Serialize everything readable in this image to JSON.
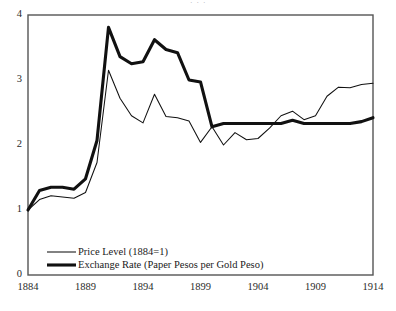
{
  "figure": {
    "top_clipped_text": "·                    ·                    ·",
    "background": "#ffffff",
    "frame_color": "#4d4d4d"
  },
  "chart_data": {
    "type": "line",
    "title": "",
    "subtitle": "",
    "xlabel": "",
    "ylabel": "",
    "xlim": [
      1884,
      1914
    ],
    "ylim": [
      0,
      4
    ],
    "grid": false,
    "legend_position": "bottom-left",
    "xticks": [
      1884,
      1889,
      1894,
      1899,
      1904,
      1909,
      1914
    ],
    "xtick_labels": [
      "1884",
      "1889",
      "1894",
      "1899",
      "1904",
      "1909",
      "1914"
    ],
    "yticks": [
      0,
      1,
      2,
      3,
      4
    ],
    "ytick_labels": [
      "0",
      "1",
      "2",
      "3",
      "4"
    ],
    "x": [
      1884,
      1885,
      1886,
      1887,
      1888,
      1889,
      1890,
      1891,
      1892,
      1893,
      1894,
      1895,
      1896,
      1897,
      1898,
      1899,
      1900,
      1901,
      1902,
      1903,
      1904,
      1905,
      1906,
      1907,
      1908,
      1909,
      1910,
      1911,
      1912,
      1913,
      1914
    ],
    "series": [
      {
        "name": "Price Level (1884=1)",
        "color": "#111111",
        "linewidth": 1.0,
        "style": "thin",
        "values": [
          1.0,
          1.16,
          1.22,
          1.2,
          1.18,
          1.27,
          1.73,
          3.15,
          2.72,
          2.45,
          2.34,
          2.78,
          2.44,
          2.42,
          2.37,
          2.04,
          2.28,
          2.0,
          2.19,
          2.08,
          2.1,
          2.26,
          2.45,
          2.52,
          2.39,
          2.45,
          2.75,
          2.89,
          2.88,
          2.93,
          2.95
        ]
      },
      {
        "name": "Exchange Rate (Paper Pesos per Gold Peso)",
        "color": "#111111",
        "linewidth": 3.0,
        "style": "bold",
        "values": [
          1.0,
          1.3,
          1.35,
          1.35,
          1.32,
          1.48,
          2.07,
          3.81,
          3.36,
          3.25,
          3.28,
          3.62,
          3.47,
          3.42,
          3.0,
          2.97,
          2.28,
          2.33,
          2.33,
          2.33,
          2.33,
          2.33,
          2.33,
          2.38,
          2.33,
          2.33,
          2.33,
          2.33,
          2.33,
          2.36,
          2.42
        ]
      }
    ],
    "legend": [
      {
        "label": "Price Level (1884=1)",
        "style": "thin"
      },
      {
        "label": "Exchange Rate (Paper Pesos per Gold Peso)",
        "style": "bold"
      }
    ]
  }
}
